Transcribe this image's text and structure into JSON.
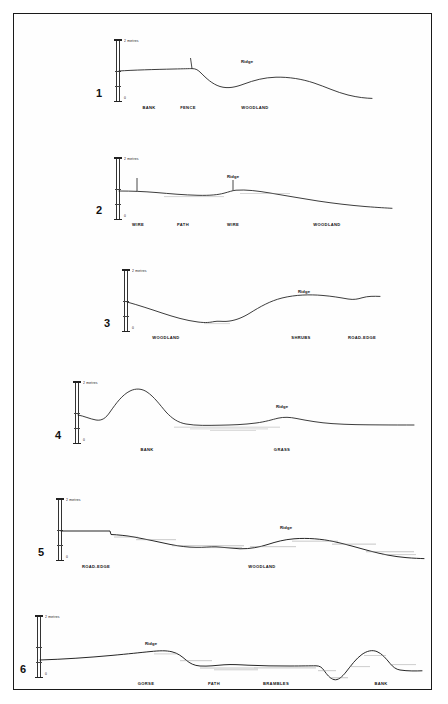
{
  "figure": {
    "type": "landscape-cross-section-plate",
    "background_color": "#ffffff",
    "border_color": "#1a1a1a",
    "line_color": "#1a1a1a",
    "stipple_color": "#9a9a9a",
    "scale": {
      "top_label": "2 metres",
      "bottom_label": "0"
    }
  },
  "panels": [
    {
      "number": "1",
      "ridge_label": "Ridge",
      "features": [
        {
          "label": "BANK"
        },
        {
          "label": "FENCE"
        },
        {
          "label": "WOODLAND"
        }
      ]
    },
    {
      "number": "2",
      "ridge_label": "Ridge",
      "features": [
        {
          "label": "WIRE"
        },
        {
          "label": "PATH"
        },
        {
          "label": "WIRE"
        },
        {
          "label": "WOODLAND"
        }
      ]
    },
    {
      "number": "3",
      "ridge_label": "Ridge",
      "features": [
        {
          "label": "WOODLAND"
        },
        {
          "label": "SHRUBS"
        },
        {
          "label": "ROAD-EDGE"
        }
      ]
    },
    {
      "number": "4",
      "ridge_label": "Ridge",
      "features": [
        {
          "label": "BANK"
        },
        {
          "label": "GRASS"
        }
      ]
    },
    {
      "number": "5",
      "ridge_label": "Ridge",
      "features": [
        {
          "label": "ROAD-EDGE"
        },
        {
          "label": "WOODLAND"
        }
      ]
    },
    {
      "number": "6",
      "ridge_label": "Ridge",
      "features": [
        {
          "label": "GORSE"
        },
        {
          "label": "PATH"
        },
        {
          "label": "BRAMBLES"
        },
        {
          "label": "BANK"
        }
      ]
    }
  ]
}
